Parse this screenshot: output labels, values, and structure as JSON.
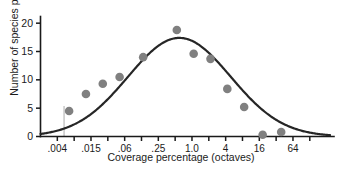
{
  "chart_data": {
    "type": "scatter",
    "title": "",
    "subtitle": "",
    "xlabel": "Coverage percentage (octaves)",
    "ylabel": "Number of species per octave",
    "grid": false,
    "legend": false,
    "x_scale": "log2-octaves",
    "xlim_octaves": [
      -9.0,
      8.2
    ],
    "ylim": [
      0,
      21
    ],
    "x_tick_labels": [
      ".004",
      ".015",
      ".06",
      ".25",
      "1.0",
      "4",
      "16",
      "64"
    ],
    "x_tick_octaves": [
      -8,
      -6,
      -4,
      -2,
      0,
      2,
      4,
      6
    ],
    "x_minor_tick_octaves": [
      -7,
      -5,
      -3,
      -1,
      1,
      3,
      5,
      7
    ],
    "y_tick_labels": [
      "0",
      "5",
      "10",
      "15",
      "20"
    ],
    "y_ticks": [
      0,
      5,
      10,
      15,
      20
    ],
    "points": [
      {
        "x_octave": -7.3,
        "y": 4.5
      },
      {
        "x_octave": -6.3,
        "y": 7.5
      },
      {
        "x_octave": -5.3,
        "y": 9.3
      },
      {
        "x_octave": -4.3,
        "y": 10.5
      },
      {
        "x_octave": -2.9,
        "y": 14.0
      },
      {
        "x_octave": -0.9,
        "y": 18.8
      },
      {
        "x_octave": 0.1,
        "y": 14.6
      },
      {
        "x_octave": 1.1,
        "y": 13.7
      },
      {
        "x_octave": 2.1,
        "y": 8.4
      },
      {
        "x_octave": 3.1,
        "y": 5.2
      },
      {
        "x_octave": 4.2,
        "y": 0.3
      },
      {
        "x_octave": 5.3,
        "y": 0.8
      }
    ],
    "fitted_curve": {
      "name": "lognormal fit",
      "peak_x_octave": -0.75,
      "peak_y": 17.4,
      "sd_octaves": 3.05
    },
    "veil_line": {
      "x_octave": -7.6,
      "y_top": 5.4
    },
    "colors": {
      "point": "#808080",
      "curve": "#262626",
      "axis": "#1a1a1a",
      "veil_line": "#b3b3b3",
      "text": "#1a1a1a",
      "background": "#ffffff"
    }
  }
}
